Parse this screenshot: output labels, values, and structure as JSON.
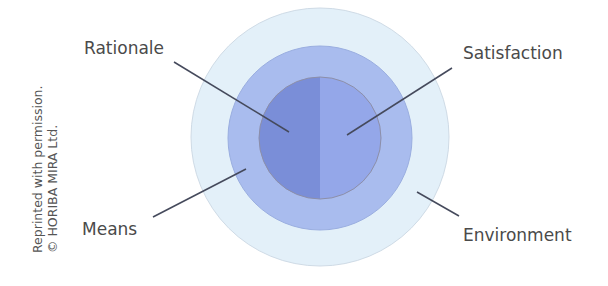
{
  "diagram": {
    "title": "",
    "rings": [
      {
        "name": "Environment",
        "color": "#e3f0f9",
        "stroke": "#cfdbe6"
      },
      {
        "name": "Means",
        "color": "#a9bcee",
        "stroke": "#9aaee0"
      },
      {
        "name": "core",
        "left_color": "#7a8ed8",
        "right_color": "#94a7e9",
        "stroke": "#8d8fa8"
      }
    ],
    "labels": {
      "rationale": "Rationale",
      "satisfaction": "Satisfaction",
      "means": "Means",
      "environment": "Environment"
    },
    "leader_line_color": "#454a5c"
  },
  "credit": {
    "line1": "Reprinted with permission.",
    "line2": "© HORIBA MIRA Ltd."
  }
}
